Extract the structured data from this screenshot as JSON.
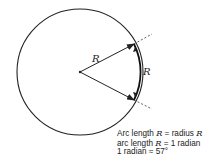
{
  "diagram": {
    "labels": {
      "radius_label": "R",
      "arc_label": "R"
    },
    "caption": [
      {
        "pre": "Arc length ",
        "var": "R",
        "post": " = radius ",
        "var2": "R"
      },
      {
        "pre": "arc length ",
        "var": "R",
        "post": " = 1 radian",
        "var2": ""
      },
      {
        "pre": "1 radian ≈ 57°",
        "var": "",
        "post": "",
        "var2": ""
      }
    ],
    "colors": {
      "stroke": "#222222",
      "background": "#ffffff"
    }
  }
}
